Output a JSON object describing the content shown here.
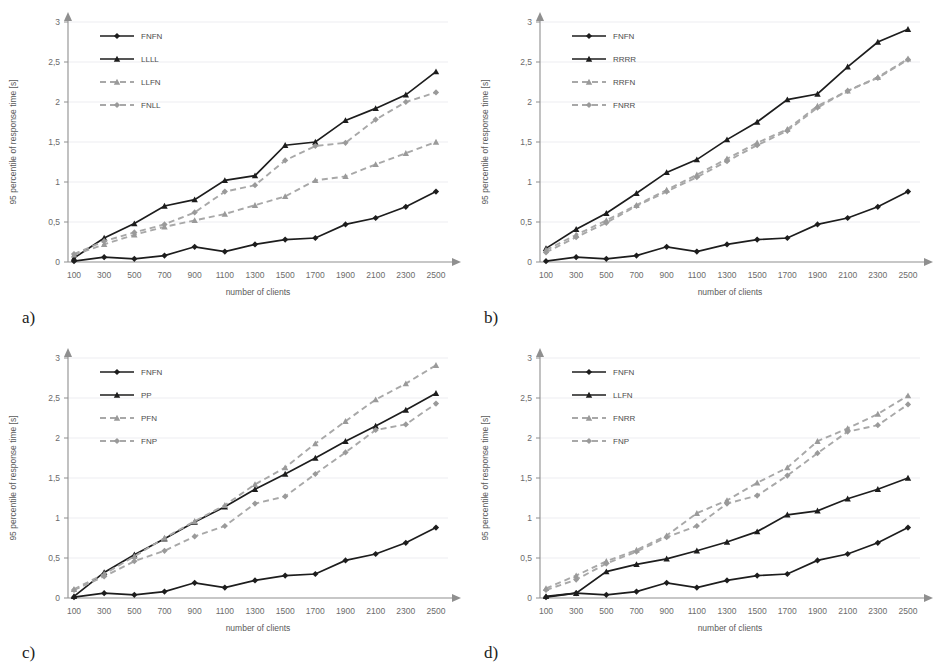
{
  "figure": {
    "panels": [
      {
        "key": "a",
        "label": "a)"
      },
      {
        "key": "b",
        "label": "b)"
      },
      {
        "key": "c",
        "label": "c)"
      },
      {
        "key": "d",
        "label": "d)"
      }
    ],
    "axis": {
      "xlabel": "number of clients",
      "ylabel": "95 percentile of response time [s]",
      "ytick_labels": [
        "0",
        "0,5",
        "1",
        "1,5",
        "2",
        "2,5",
        "3"
      ],
      "ytick_values": [
        0,
        0.5,
        1,
        1.5,
        2,
        2.5,
        3
      ],
      "xtick_labels": [
        "100",
        "300",
        "500",
        "700",
        "900",
        "1100",
        "1300",
        "1500",
        "1700",
        "1900",
        "2100",
        "2300",
        "2500"
      ]
    },
    "colors": {
      "solid": "#1d1d1d",
      "dashed": "#a8a8a8",
      "grid": "#e8e8ee",
      "axis": "#8f8f8f",
      "text": "#6b6b6b",
      "background": "#ffffff"
    }
  },
  "chart_data": [
    {
      "panel": "a",
      "type": "line",
      "title": "",
      "xlabel": "number of clients",
      "ylabel": "95 percentile of response time [s]",
      "xlim": [
        100,
        2500
      ],
      "ylim": [
        0,
        3
      ],
      "grid": true,
      "legend_position": "top-left",
      "categories": [
        100,
        300,
        500,
        700,
        900,
        1100,
        1300,
        1500,
        1700,
        1900,
        2100,
        2300,
        2500
      ],
      "series": [
        {
          "name": "FNFN",
          "style": "solid",
          "marker": "diamond",
          "values": [
            0.01,
            0.06,
            0.04,
            0.08,
            0.19,
            0.13,
            0.22,
            0.28,
            0.3,
            0.47,
            0.55,
            0.69,
            0.88
          ]
        },
        {
          "name": "LLLL",
          "style": "solid",
          "marker": "triangle",
          "values": [
            0.05,
            0.3,
            0.48,
            0.7,
            0.78,
            1.02,
            1.08,
            1.46,
            1.5,
            1.77,
            1.92,
            2.09,
            2.38
          ]
        },
        {
          "name": "LLFN",
          "style": "dashed",
          "marker": "triangle",
          "values": [
            0.09,
            0.22,
            0.34,
            0.44,
            0.52,
            0.6,
            0.71,
            0.82,
            1.02,
            1.07,
            1.22,
            1.36,
            1.5
          ]
        },
        {
          "name": "FNLL",
          "style": "dashed",
          "marker": "diamond",
          "values": [
            0.1,
            0.26,
            0.37,
            0.47,
            0.62,
            0.88,
            0.96,
            1.27,
            1.45,
            1.49,
            1.78,
            2.0,
            2.12
          ]
        }
      ]
    },
    {
      "panel": "b",
      "type": "line",
      "title": "",
      "xlabel": "number of clients",
      "ylabel": "95 percentile of response time [s]",
      "xlim": [
        100,
        2500
      ],
      "ylim": [
        0,
        3
      ],
      "grid": true,
      "legend_position": "top-left",
      "categories": [
        100,
        300,
        500,
        700,
        900,
        1100,
        1300,
        1500,
        1700,
        1900,
        2100,
        2300,
        2500
      ],
      "series": [
        {
          "name": "FNFN",
          "style": "solid",
          "marker": "diamond",
          "values": [
            0.01,
            0.06,
            0.04,
            0.08,
            0.19,
            0.13,
            0.22,
            0.28,
            0.3,
            0.47,
            0.55,
            0.69,
            0.88
          ]
        },
        {
          "name": "RRRR",
          "style": "solid",
          "marker": "triangle",
          "values": [
            0.17,
            0.41,
            0.61,
            0.86,
            1.12,
            1.28,
            1.53,
            1.75,
            2.03,
            2.1,
            2.44,
            2.75,
            2.91
          ]
        },
        {
          "name": "RRFN",
          "style": "dashed",
          "marker": "triangle",
          "values": [
            0.15,
            0.34,
            0.52,
            0.71,
            0.9,
            1.09,
            1.29,
            1.49,
            1.66,
            1.95,
            2.14,
            2.31,
            2.54
          ]
        },
        {
          "name": "FNRR",
          "style": "dashed",
          "marker": "diamond",
          "values": [
            0.12,
            0.31,
            0.49,
            0.7,
            0.88,
            1.06,
            1.26,
            1.46,
            1.64,
            1.93,
            2.14,
            2.3,
            2.53
          ]
        }
      ]
    },
    {
      "panel": "c",
      "type": "line",
      "title": "",
      "xlabel": "number of clients",
      "ylabel": "95 percentile of response time [s]",
      "xlim": [
        100,
        2500
      ],
      "ylim": [
        0,
        3
      ],
      "grid": true,
      "legend_position": "top-left",
      "categories": [
        100,
        300,
        500,
        700,
        900,
        1100,
        1300,
        1500,
        1700,
        1900,
        2100,
        2300,
        2500
      ],
      "series": [
        {
          "name": "FNFN",
          "style": "solid",
          "marker": "diamond",
          "values": [
            0.01,
            0.06,
            0.04,
            0.08,
            0.19,
            0.13,
            0.22,
            0.28,
            0.3,
            0.47,
            0.55,
            0.69,
            0.88
          ]
        },
        {
          "name": "PP",
          "style": "solid",
          "marker": "triangle",
          "values": [
            0.02,
            0.32,
            0.54,
            0.74,
            0.95,
            1.14,
            1.36,
            1.55,
            1.75,
            1.96,
            2.15,
            2.35,
            2.56
          ]
        },
        {
          "name": "PFN",
          "style": "dashed",
          "marker": "triangle",
          "values": [
            0.11,
            0.3,
            0.52,
            0.75,
            0.96,
            1.16,
            1.42,
            1.63,
            1.93,
            2.21,
            2.48,
            2.68,
            2.91
          ]
        },
        {
          "name": "FNP",
          "style": "dashed",
          "marker": "diamond",
          "values": [
            0.1,
            0.27,
            0.46,
            0.59,
            0.77,
            0.9,
            1.18,
            1.27,
            1.55,
            1.82,
            2.1,
            2.17,
            2.43
          ]
        }
      ]
    },
    {
      "panel": "d",
      "type": "line",
      "title": "",
      "xlabel": "number of clients",
      "ylabel": "95 percentile of response time [s]",
      "xlim": [
        100,
        2500
      ],
      "ylim": [
        0,
        3
      ],
      "grid": true,
      "legend_position": "top-left",
      "categories": [
        100,
        300,
        500,
        700,
        900,
        1100,
        1300,
        1500,
        1700,
        1900,
        2100,
        2300,
        2500
      ],
      "series": [
        {
          "name": "FNFN",
          "style": "solid",
          "marker": "diamond",
          "values": [
            0.01,
            0.06,
            0.04,
            0.08,
            0.19,
            0.13,
            0.22,
            0.28,
            0.3,
            0.47,
            0.55,
            0.69,
            0.88
          ]
        },
        {
          "name": "LLFN",
          "style": "solid",
          "marker": "triangle",
          "values": [
            0.02,
            0.06,
            0.33,
            0.42,
            0.49,
            0.59,
            0.7,
            0.83,
            1.04,
            1.09,
            1.24,
            1.36,
            1.5
          ]
        },
        {
          "name": "FNRR",
          "style": "dashed",
          "marker": "triangle",
          "values": [
            0.12,
            0.28,
            0.46,
            0.6,
            0.78,
            1.06,
            1.22,
            1.44,
            1.63,
            1.96,
            2.12,
            2.3,
            2.53
          ]
        },
        {
          "name": "FNP",
          "style": "dashed",
          "marker": "diamond",
          "values": [
            0.1,
            0.23,
            0.43,
            0.58,
            0.76,
            0.9,
            1.18,
            1.28,
            1.53,
            1.81,
            2.08,
            2.16,
            2.42
          ]
        }
      ]
    }
  ]
}
